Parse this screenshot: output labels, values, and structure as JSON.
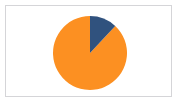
{
  "chart": {
    "title": "",
    "frame_border_color": "#d5d5d8",
    "background_color": "#ffffff"
  },
  "chart_data": {
    "type": "pie",
    "title": "",
    "subtitle": "",
    "xlabel": "",
    "ylabel": "",
    "legend": "none",
    "grid": false,
    "start_angle_deg": 0,
    "direction": "clockwise",
    "categories": [
      "Series 1",
      "Series 2"
    ],
    "values": [
      88,
      12
    ],
    "slices": [
      {
        "label": "Series 1",
        "value": 88,
        "percent": "88%",
        "color": "#fc9022",
        "start_deg": 43,
        "end_deg": 360
      },
      {
        "label": "Series 2",
        "value": 12,
        "percent": "12%",
        "color": "#30527e",
        "start_deg": 0,
        "end_deg": 43
      }
    ],
    "colors": [
      "#fc9022",
      "#30527e"
    ]
  }
}
